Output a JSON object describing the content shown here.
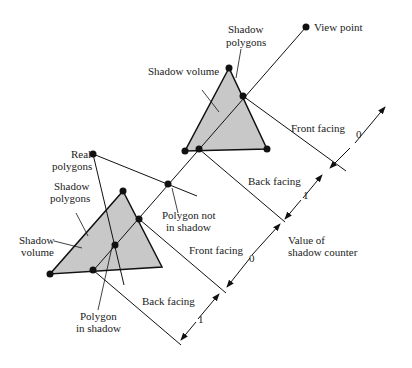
{
  "diagram": {
    "colors": {
      "fill": "#c8c8c8",
      "stroke": "#111111",
      "text": "#222222"
    },
    "labels": {
      "view_point": "View point",
      "shadow_polygons_top_1": "Shadow",
      "shadow_polygons_top_2": "polygons",
      "shadow_volume_top": "Shadow volume",
      "front_facing_top": "Front facing",
      "back_facing_top": "Back facing",
      "real_polygons_1": "Real",
      "real_polygons_2": "polygons",
      "shadow_polygons_bottom_1": "Shadow",
      "shadow_polygons_bottom_2": "polygons",
      "shadow_volume_bottom_1": "Shadow",
      "shadow_volume_bottom_2": "volume",
      "polygon_not_in_shadow_1": "Polygon not",
      "polygon_not_in_shadow_2": "in shadow",
      "front_facing_bottom": "Front facing",
      "back_facing_bottom": "Back facing",
      "polygon_in_shadow_1": "Polygon",
      "polygon_in_shadow_2": "in shadow",
      "counter_1": "Value of",
      "counter_2": "shadow counter"
    },
    "counter_values": [
      "0",
      "1",
      "0",
      "1"
    ]
  }
}
